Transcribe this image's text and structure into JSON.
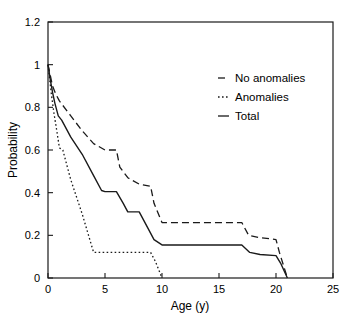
{
  "chart_data": {
    "type": "line",
    "title": "",
    "xlabel": "Age (y)",
    "ylabel": "Probability",
    "xlim": [
      0,
      25
    ],
    "ylim": [
      0,
      1.2
    ],
    "xticks": [
      0,
      5,
      10,
      15,
      20,
      25
    ],
    "xtick_labels": [
      "0",
      "5",
      "10",
      "15",
      "20",
      "25"
    ],
    "yticks": [
      0,
      0.2,
      0.4,
      0.6,
      0.8,
      1,
      1.2
    ],
    "ytick_labels": [
      "0",
      "0.2",
      "0.4",
      "0.6",
      "0.8",
      "1",
      "1.2"
    ],
    "grid": false,
    "legend_position": "upper-right-inside",
    "series": [
      {
        "name": "No anomalies",
        "style": "dashed",
        "color": "#1a1a1a",
        "points": [
          [
            0,
            1.0
          ],
          [
            0.2,
            0.95
          ],
          [
            0.4,
            0.9
          ],
          [
            0.7,
            0.86
          ],
          [
            1.0,
            0.83
          ],
          [
            2.0,
            0.76
          ],
          [
            3.0,
            0.69
          ],
          [
            4.0,
            0.63
          ],
          [
            5.0,
            0.6
          ],
          [
            6.0,
            0.6
          ],
          [
            6.3,
            0.52
          ],
          [
            7.0,
            0.47
          ],
          [
            8.0,
            0.44
          ],
          [
            9.0,
            0.43
          ],
          [
            9.3,
            0.35
          ],
          [
            10.0,
            0.26
          ],
          [
            17.0,
            0.26
          ],
          [
            17.6,
            0.2
          ],
          [
            18.5,
            0.19
          ],
          [
            20.0,
            0.18
          ],
          [
            20.3,
            0.12
          ],
          [
            21.0,
            0.0
          ]
        ]
      },
      {
        "name": "Anomalies",
        "style": "dotted",
        "color": "#1a1a1a",
        "points": [
          [
            0,
            1.0
          ],
          [
            0.15,
            0.93
          ],
          [
            0.3,
            0.86
          ],
          [
            0.5,
            0.78
          ],
          [
            0.8,
            0.68
          ],
          [
            1.0,
            0.61
          ],
          [
            1.3,
            0.6
          ],
          [
            2.0,
            0.46
          ],
          [
            3.0,
            0.3
          ],
          [
            4.0,
            0.12
          ],
          [
            9.0,
            0.12
          ],
          [
            9.4,
            0.08
          ],
          [
            10.0,
            0.0
          ]
        ]
      },
      {
        "name": "Total",
        "style": "solid",
        "color": "#1a1a1a",
        "points": [
          [
            0,
            1.0
          ],
          [
            0.2,
            0.93
          ],
          [
            0.4,
            0.87
          ],
          [
            0.6,
            0.82
          ],
          [
            0.9,
            0.76
          ],
          [
            1.2,
            0.74
          ],
          [
            2.0,
            0.66
          ],
          [
            3.0,
            0.58
          ],
          [
            4.0,
            0.48
          ],
          [
            4.7,
            0.41
          ],
          [
            5.0,
            0.405
          ],
          [
            6.0,
            0.405
          ],
          [
            6.6,
            0.35
          ],
          [
            7.0,
            0.31
          ],
          [
            8.0,
            0.31
          ],
          [
            8.4,
            0.27
          ],
          [
            9.3,
            0.18
          ],
          [
            10.0,
            0.155
          ],
          [
            17.0,
            0.155
          ],
          [
            17.7,
            0.12
          ],
          [
            18.6,
            0.11
          ],
          [
            20.0,
            0.105
          ],
          [
            20.4,
            0.07
          ],
          [
            21.0,
            0.0
          ]
        ]
      }
    ],
    "legend": [
      {
        "label": "No anomalies",
        "style": "dashed"
      },
      {
        "label": "Anomalies",
        "style": "dotted"
      },
      {
        "label": "Total",
        "style": "solid"
      }
    ]
  }
}
